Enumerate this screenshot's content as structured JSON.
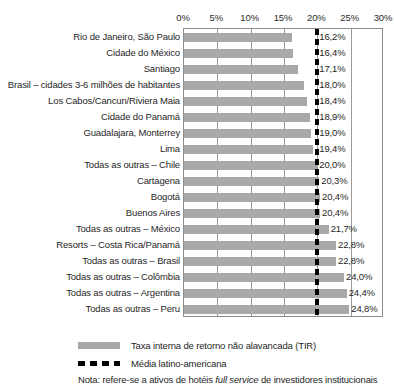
{
  "chart_data": {
    "type": "bar",
    "orientation": "horizontal",
    "title": "",
    "xlabel": "",
    "ylabel": "",
    "xlim": [
      0,
      30
    ],
    "xtick_labels": [
      "0%",
      "5%",
      "10%",
      "15%",
      "20%",
      "25%",
      "30%"
    ],
    "xtick_values": [
      0,
      5,
      10,
      15,
      20,
      25,
      30
    ],
    "grid": true,
    "grid_axis": "x",
    "legend_position": "bottom-left",
    "categories": [
      "Rio de Janeiro, São Paulo",
      "Cidade do México",
      "Santiago",
      "Brasil – cidades 3-6 milhões de habitantes",
      "Los Cabos/Cancun/Riviera Maia",
      "Cidade do Panamá",
      "Guadalajara, Monterrey",
      "Lima",
      "Todas as outras – Chile",
      "Cartagena",
      "Bogotá",
      "Buenos Aires",
      "Todas as outras – México",
      "Resorts – Costa Rica/Panamá",
      "Todas as outras – Brasil",
      "Todas as outras – Colômbia",
      "Todas as outras – Argentina",
      "Todas as outras – Peru"
    ],
    "values": [
      16.2,
      16.4,
      17.1,
      18.0,
      18.4,
      18.9,
      19.0,
      19.4,
      20.0,
      20.3,
      20.4,
      20.4,
      21.7,
      22.8,
      22.8,
      24.0,
      24.4,
      24.8
    ],
    "value_labels": [
      "16,2%",
      "16,4%",
      "17,1%",
      "18,0%",
      "18,4%",
      "18,9%",
      "19,0%",
      "19,4%",
      "20,0%",
      "20,3%",
      "20,4%",
      "20,4%",
      "21,7%",
      "22,8%",
      "22,8%",
      "24,0%",
      "24,4%",
      "24,8%"
    ],
    "series": [
      {
        "name": "Taxa interna de retorno não alavancada (TIR)",
        "values": [
          16.2,
          16.4,
          17.1,
          18.0,
          18.4,
          18.9,
          19.0,
          19.4,
          20.0,
          20.3,
          20.4,
          20.4,
          21.7,
          22.8,
          22.8,
          24.0,
          24.4,
          24.8
        ],
        "color": "#a9a9a9"
      }
    ],
    "reference_line": {
      "name": "Média latino-americana",
      "value": 20.0,
      "label": "20%",
      "style": "dashed",
      "color": "#000000"
    },
    "annotations": [
      "Nota: refere-se a ativos de hotéis full service de investidores institucionais"
    ]
  },
  "legend": {
    "items": [
      {
        "marker": "bar-swatch",
        "label": "Taxa interna de retorno não alavancada (TIR)"
      },
      {
        "marker": "dashed-line-swatch",
        "label": "Média latino-americana"
      }
    ]
  },
  "note": {
    "prefix": "Nota: refere-se a ativos de hotéis ",
    "italic": "full service",
    "suffix": " de investidores institucionais"
  },
  "colors": {
    "bar": "#a9a9a9",
    "reference_line": "#000000",
    "grid": "#9a9a9a",
    "frame": "#8d8d8d",
    "text": "#1f1f1f"
  }
}
